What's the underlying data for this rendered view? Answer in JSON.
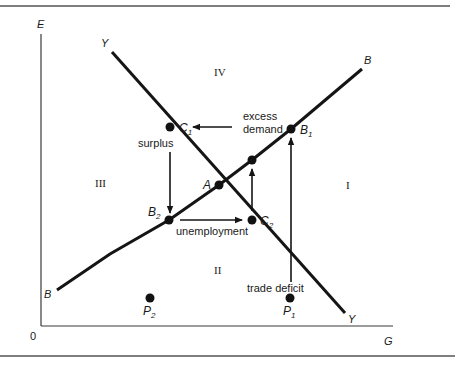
{
  "figure": {
    "axes": {
      "y_label": "E",
      "x_label": "G",
      "origin_label": "0"
    },
    "curves": [
      {
        "id": "YY",
        "label_start": "Y",
        "label_end": "Y",
        "slope": "negative"
      },
      {
        "id": "BB",
        "label_start": "B",
        "label_end": "B",
        "slope": "positive"
      }
    ],
    "regions": {
      "I": "I",
      "II": "II",
      "III": "III",
      "IV": "IV"
    },
    "points": {
      "A": "A",
      "B1_base": "B",
      "B1_sub": "1",
      "B2_base": "B",
      "B2_sub": "2",
      "C1_base": "C",
      "C1_sub": "1",
      "C2_base": "C",
      "C2_sub": "2",
      "P1_base": "P",
      "P1_sub": "1",
      "P2_base": "P",
      "P2_sub": "2"
    },
    "annotations": {
      "excess_demand_line1": "excess",
      "excess_demand_line2": "demand",
      "surplus": "surplus",
      "unemployment": "unemployment",
      "trade_deficit": "trade deficit"
    },
    "colors": {
      "ink": "#151515",
      "background": "#ffffff",
      "rule": "#555555"
    }
  }
}
